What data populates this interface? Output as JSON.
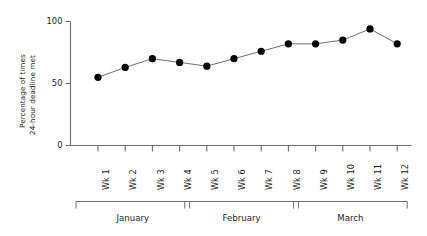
{
  "chart_data": {
    "type": "line",
    "title": "",
    "xlabel": "",
    "ylabel": "Percentage of times 24-hour deadline met",
    "ylabel_line1": "Percentage of times",
    "ylabel_line2": "24-hour deadline met",
    "categories": [
      "Wk 1",
      "Wk 2",
      "Wk 3",
      "Wk 4",
      "Wk 5",
      "Wk 6",
      "Wk 7",
      "Wk 8",
      "Wk 9",
      "Wk 10",
      "Wk 11",
      "Wk 12"
    ],
    "values": [
      55,
      63,
      70,
      67,
      64,
      70,
      76,
      82,
      82,
      85,
      94,
      82
    ],
    "ylim": [
      0,
      100
    ],
    "yticks": [
      0,
      50,
      100
    ],
    "ytick_labels": [
      "0",
      "50",
      "100"
    ],
    "grid": false,
    "legend": null,
    "marker": "filled-circle",
    "marker_color": "#000000",
    "line_color": "#6e6e6e",
    "axis_color": "#6e6e6e",
    "groups": [
      {
        "label": "January",
        "from": "Wk 1",
        "to": "Wk 4"
      },
      {
        "label": "February",
        "from": "Wk 5",
        "to": "Wk 8"
      },
      {
        "label": "March",
        "from": "Wk 9",
        "to": "Wk 12"
      }
    ]
  }
}
